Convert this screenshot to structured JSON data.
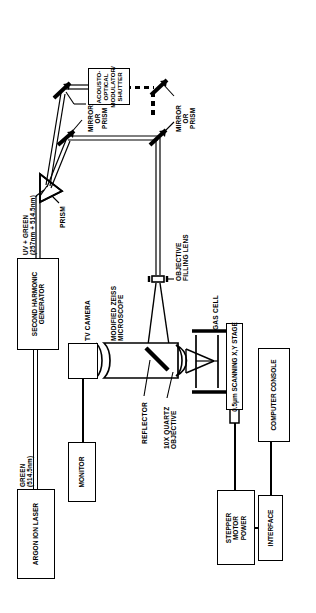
{
  "figure": {
    "orientation": "rotated-90",
    "ink_color": "#000000",
    "background_color": "#ffffff"
  },
  "components": {
    "argon_ion_laser": "ARGON ION LASER",
    "second_harmonic_generator": "SECOND HARMONIC\nGENERATOR",
    "acousto_optical_modulator": "ACOUSTO-\nOPTICAL\nMODULATOR/\nSHUTTER",
    "tv_camera": "TV CAMERA",
    "monitor": "MONITOR",
    "modified_zeiss_microscope": "MODIFIED ZEISS\nMICROSCOPE",
    "gas_cell": "GAS CELL",
    "scanning_stage": "0.5μm SCANNING X,Y STAGE",
    "computer_console": "COMPUTER CONSOLE",
    "stepper_motor_power": "STEPPER\nMOTOR\nPOWER",
    "interface": "INTERFACE"
  },
  "optics": {
    "prism": "PRISM",
    "mirror_or_prism_1": "MIRROR\nOR\nPRISM",
    "mirror_or_prism_2": "MIRROR\nOR\nPRISM",
    "objective_filling_lens": "OBJECTIVE\nFILLING LENS",
    "reflector": "REFLECTOR",
    "quartz_objective": "10X QUARTZ\nOBJECTIVE"
  },
  "beams": {
    "green": "GREEN\n(514.5nm)",
    "uv_plus_green": "UV + GREEN\n(257nm + 514.5nm)"
  }
}
